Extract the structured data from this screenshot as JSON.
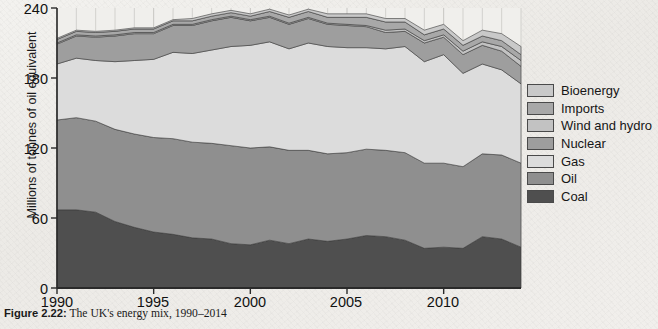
{
  "caption": {
    "figure_number": "Figure 2.22:",
    "text": " The UK's energy mix, 1990–2014"
  },
  "axes": {
    "ylabel": "Millions of tonnes of oil equivalent",
    "yticks": [
      "0",
      "60",
      "120",
      "180",
      "240"
    ],
    "xticks": [
      "1990",
      "1995",
      "2000",
      "2005",
      "2010"
    ]
  },
  "legend": {
    "items": [
      {
        "label": "Bioenergy",
        "color": "#c9c9c9"
      },
      {
        "label": "Imports",
        "color": "#a8a8a8"
      },
      {
        "label": "Wind and hydro",
        "color": "#c2c2c2"
      },
      {
        "label": "Nuclear",
        "color": "#9e9e9e"
      },
      {
        "label": "Gas",
        "color": "#dcdcdc"
      },
      {
        "label": "Oil",
        "color": "#8f8f8f"
      },
      {
        "label": "Coal",
        "color": "#4f4f4f"
      }
    ]
  },
  "chart_data": {
    "type": "area",
    "stacked": true,
    "title": "The UK's energy mix, 1990–2014",
    "xlabel": "",
    "ylabel": "Millions of tonnes of oil equivalent",
    "xlim": [
      1990,
      2014
    ],
    "ylim": [
      0,
      240
    ],
    "grid": true,
    "legend_position": "right",
    "x": [
      1990,
      1991,
      1992,
      1993,
      1994,
      1995,
      1996,
      1997,
      1998,
      1999,
      2000,
      2001,
      2002,
      2003,
      2004,
      2005,
      2006,
      2007,
      2008,
      2009,
      2010,
      2011,
      2012,
      2013,
      2014
    ],
    "series": [
      {
        "name": "Coal",
        "color": "#4f4f4f",
        "values": [
          67,
          67,
          65,
          57,
          52,
          48,
          46,
          43,
          42,
          38,
          37,
          41,
          38,
          42,
          40,
          42,
          45,
          44,
          41,
          34,
          35,
          34,
          44,
          42,
          35
        ]
      },
      {
        "name": "Oil",
        "color": "#8f8f8f",
        "values": [
          77,
          79,
          78,
          79,
          80,
          81,
          82,
          82,
          82,
          84,
          83,
          80,
          80,
          76,
          75,
          74,
          74,
          74,
          75,
          73,
          72,
          70,
          71,
          72,
          72
        ]
      },
      {
        "name": "Gas",
        "color": "#dcdcdc",
        "values": [
          48,
          51,
          52,
          58,
          63,
          67,
          74,
          76,
          80,
          85,
          88,
          90,
          87,
          92,
          92,
          90,
          87,
          87,
          91,
          87,
          93,
          80,
          77,
          73,
          68
        ]
      },
      {
        "name": "Nuclear",
        "color": "#9e9e9e",
        "values": [
          17,
          19,
          20,
          22,
          23,
          22,
          23,
          24,
          25,
          25,
          21,
          21,
          21,
          21,
          19,
          19,
          18,
          14,
          13,
          16,
          15,
          16,
          16,
          16,
          15
        ]
      },
      {
        "name": "Wind and hydro",
        "color": "#c2c2c2",
        "values": [
          1,
          1,
          1,
          1,
          1,
          1,
          1,
          1,
          1,
          1,
          1,
          1,
          1,
          1,
          1,
          1,
          1,
          2,
          2,
          2,
          2,
          3,
          3,
          4,
          5
        ]
      },
      {
        "name": "Imports",
        "color": "#a8a8a8",
        "values": [
          3,
          3,
          3,
          3,
          3,
          3,
          3,
          3,
          3,
          3,
          3,
          4,
          5,
          5,
          5,
          6,
          7,
          7,
          6,
          5,
          5,
          5,
          5,
          5,
          5
        ]
      },
      {
        "name": "Bioenergy",
        "color": "#c9c9c9",
        "values": [
          1,
          1,
          1,
          1,
          1,
          1,
          1,
          2,
          2,
          2,
          2,
          2,
          2,
          2,
          3,
          3,
          3,
          3,
          3,
          4,
          4,
          4,
          5,
          6,
          7
        ]
      }
    ]
  }
}
